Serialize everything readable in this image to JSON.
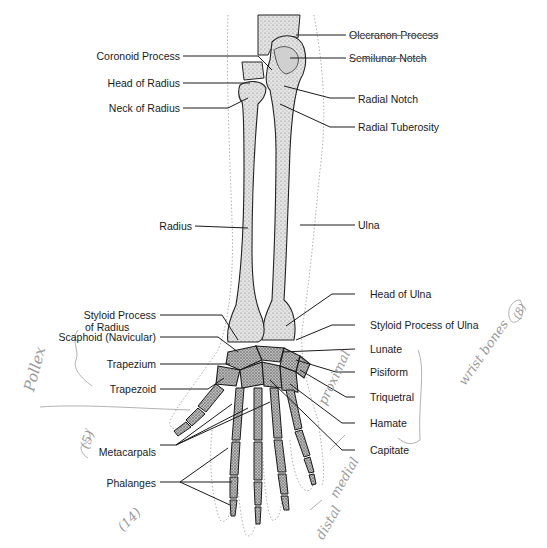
{
  "diagram": {
    "colors": {
      "ink": "#1a1a1a",
      "bone_fill": "#dcdcdc",
      "bone_shade": "#8a8a8a",
      "pencil": "#9a9a9a",
      "outline_dotted": "#999999"
    },
    "left_labels": [
      {
        "id": "coronoid-process",
        "text": "Coronoid Process"
      },
      {
        "id": "head-of-radius",
        "text": "Head of Radius"
      },
      {
        "id": "neck-of-radius",
        "text": "Neck of Radius"
      },
      {
        "id": "radius",
        "text": "Radius"
      },
      {
        "id": "styloid-process-radius-1",
        "text": "Styloid Process"
      },
      {
        "id": "styloid-process-radius-2",
        "text": "of Radius"
      },
      {
        "id": "scaphoid",
        "text": "Scaphoid (Navicular)"
      },
      {
        "id": "trapezium",
        "text": "Trapezium"
      },
      {
        "id": "trapezoid",
        "text": "Trapezoid"
      },
      {
        "id": "metacarpals",
        "text": "Metacarpals"
      },
      {
        "id": "phalanges",
        "text": "Phalanges"
      }
    ],
    "right_labels": [
      {
        "id": "olecranon-process",
        "text": "Olecranon Process"
      },
      {
        "id": "semilunar-notch",
        "text": "Semilunar Notch"
      },
      {
        "id": "radial-notch",
        "text": "Radial Notch"
      },
      {
        "id": "radial-tuberosity",
        "text": "Radial Tuberosity"
      },
      {
        "id": "ulna",
        "text": "Ulna"
      },
      {
        "id": "head-of-ulna",
        "text": "Head of Ulna"
      },
      {
        "id": "styloid-process-ulna",
        "text": "Styloid Process of Ulna"
      },
      {
        "id": "lunate",
        "text": "Lunate"
      },
      {
        "id": "pisiform",
        "text": "Pisiform"
      },
      {
        "id": "triquetral",
        "text": "Triquetral"
      },
      {
        "id": "hamate",
        "text": "Hamate"
      },
      {
        "id": "capitate",
        "text": "Capitate"
      }
    ],
    "handwritten_notes": [
      {
        "id": "pollex",
        "text": "Pollex"
      },
      {
        "id": "five",
        "text": "(5)"
      },
      {
        "id": "fourteen",
        "text": "(14)"
      },
      {
        "id": "proximal",
        "text": "proximal"
      },
      {
        "id": "medial",
        "text": "medial"
      },
      {
        "id": "distal",
        "text": "distal"
      },
      {
        "id": "wrist-bones",
        "text": "wrist bones"
      },
      {
        "id": "eight",
        "text": "(8)"
      }
    ]
  }
}
